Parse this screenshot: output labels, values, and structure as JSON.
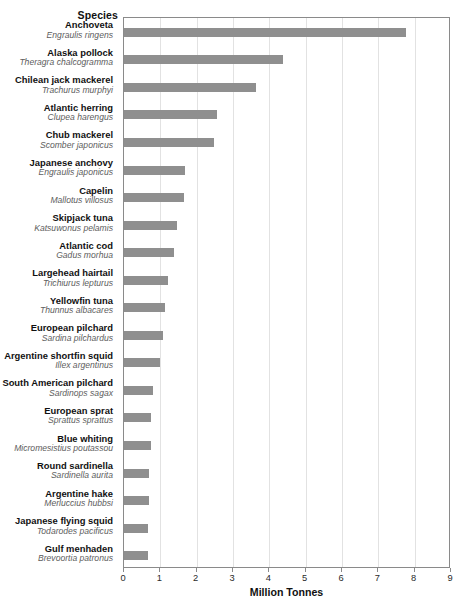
{
  "chart_data": {
    "type": "bar",
    "orientation": "horizontal",
    "title": "",
    "subtitle": "",
    "category_axis_title": "Species",
    "xlabel": "Million Tonnes",
    "ylabel": "Species",
    "xlim": [
      0,
      9
    ],
    "xticks": [
      0,
      1,
      2,
      3,
      4,
      5,
      6,
      7,
      8,
      9
    ],
    "xtick_labels": [
      "0",
      "1",
      "2",
      "3",
      "4",
      "5",
      "6",
      "7",
      "8",
      "9"
    ],
    "grid": "vertical",
    "legend": "none",
    "bar_color": "#8f8f8f",
    "categories": [
      "Anchoveta",
      "Alaska pollock",
      "Chilean jack mackerel",
      "Atlantic herring",
      "Chub mackerel",
      "Japanese anchovy",
      "Capelin",
      "Skipjack tuna",
      "Atlantic cod",
      "Largehead hairtail",
      "Yellowfin tuna",
      "European pilchard",
      "Argentine shortfin squid",
      "South American pilchard",
      "European sprat",
      "Blue whiting",
      "Round sardinella",
      "Argentine hake",
      "Japanese flying squid",
      "Gulf menhaden"
    ],
    "scientific_names": [
      "Engraulis ringens",
      "Theragra chalcogramma",
      "Trachurus murphyi",
      "Clupea harengus",
      "Scomber japonicus",
      "Engraulis japonicus",
      "Mallotus villosus",
      "Katsuwonus pelamis",
      "Gadus morhua",
      "Trichiurus lepturus",
      "Thunnus albacares",
      "Sardina pilchardus",
      "Illex argentinus",
      "Sardinops sagax",
      "Sprattus sprattus",
      "Micromesistius poutassou",
      "Sardinella aurita",
      "Merluccius hubbsi",
      "Todarodes pacificus",
      "Brevoortia patronus"
    ],
    "values": [
      7.76,
      4.38,
      3.63,
      2.56,
      2.48,
      1.68,
      1.65,
      1.46,
      1.38,
      1.21,
      1.13,
      1.06,
      0.99,
      0.79,
      0.74,
      0.74,
      0.7,
      0.68,
      0.67,
      0.66
    ],
    "rows": [
      {
        "common": "Anchoveta",
        "scientific": "Engraulis ringens",
        "value": 7.76
      },
      {
        "common": "Alaska pollock",
        "scientific": "Theragra chalcogramma",
        "value": 4.38
      },
      {
        "common": "Chilean jack mackerel",
        "scientific": "Trachurus murphyi",
        "value": 3.63
      },
      {
        "common": "Atlantic herring",
        "scientific": "Clupea harengus",
        "value": 2.56
      },
      {
        "common": "Chub mackerel",
        "scientific": "Scomber japonicus",
        "value": 2.48
      },
      {
        "common": "Japanese anchovy",
        "scientific": "Engraulis japonicus",
        "value": 1.68
      },
      {
        "common": "Capelin",
        "scientific": "Mallotus villosus",
        "value": 1.65
      },
      {
        "common": "Skipjack tuna",
        "scientific": "Katsuwonus pelamis",
        "value": 1.46
      },
      {
        "common": "Atlantic cod",
        "scientific": "Gadus morhua",
        "value": 1.38
      },
      {
        "common": "Largehead hairtail",
        "scientific": "Trichiurus lepturus",
        "value": 1.21
      },
      {
        "common": "Yellowfin tuna",
        "scientific": "Thunnus albacares",
        "value": 1.13
      },
      {
        "common": "European pilchard",
        "scientific": "Sardina pilchardus",
        "value": 1.06
      },
      {
        "common": "Argentine shortfin squid",
        "scientific": "Illex argentinus",
        "value": 0.99
      },
      {
        "common": "South American pilchard",
        "scientific": "Sardinops sagax",
        "value": 0.79
      },
      {
        "common": "European sprat",
        "scientific": "Sprattus sprattus",
        "value": 0.74
      },
      {
        "common": "Blue whiting",
        "scientific": "Micromesistius poutassou",
        "value": 0.74
      },
      {
        "common": "Round sardinella",
        "scientific": "Sardinella aurita",
        "value": 0.7
      },
      {
        "common": "Argentine hake",
        "scientific": "Merluccius hubbsi",
        "value": 0.68
      },
      {
        "common": "Japanese flying squid",
        "scientific": "Todarodes pacificus",
        "value": 0.67
      },
      {
        "common": "Gulf menhaden",
        "scientific": "Brevoortia patronus",
        "value": 0.66
      }
    ]
  }
}
